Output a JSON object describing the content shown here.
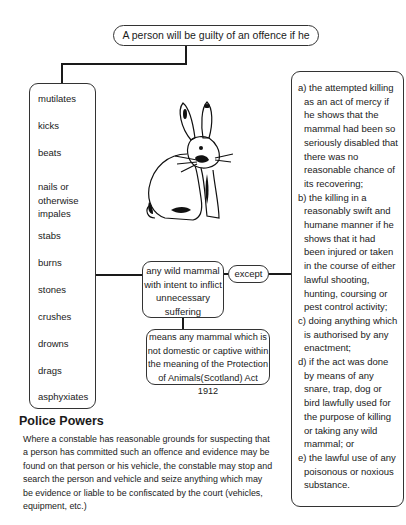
{
  "diagram": {
    "top_statement": "A person will be guilty of an offence if he",
    "actions": [
      "mutilates",
      "kicks",
      "beats",
      "nails or otherwise impales",
      "stabs",
      "burns",
      "stones",
      "crushes",
      "drowns",
      "drags",
      "asphyxiates"
    ],
    "object": "any wild mammal with intent to inflict unnecessary suffering",
    "definition": "means any mammal which is not domestic or captive within the meaning of the Protection of Animals(Scotland) Act 1912",
    "connector_label": "except",
    "exceptions": [
      "a) the attempted killing as an act of mercy if he shows that the mammal had been so seriously disabled that there was no reasonable chance of its recovering;",
      "b) the killing in a reasonably swift and humane manner if he shows that it had been injured or taken in the course of either lawful shooting, hunting, coursing or pest control activity;",
      "c) doing anything which is authorised by any enactment;",
      "d) if the act was done by means of any snare, trap, dog or bird lawfully used for the purpose of killing or taking any wild mammal; or",
      "e) the lawful use of any poisonous or noxious substance."
    ],
    "illustration": "rabbit-illustration"
  },
  "police_powers": {
    "title": "Police Powers",
    "body": "Where a constable has reasonable grounds for suspecting that a person has committed such an offence and evidence may be found on that person or his vehicle, the constable may stop and search the person and vehicle and seize anything which may be evidence or liable to be confiscated by the court (vehicles, equipment, etc.)"
  }
}
